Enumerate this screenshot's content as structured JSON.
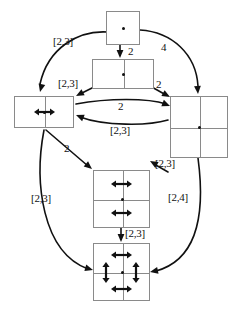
{
  "figure": {
    "type": "state-transition-diagram",
    "background_color": "#ffffff",
    "box_stroke_color": "#8a8a8a",
    "edge_stroke_color": "#111111",
    "label_color": "#111111"
  },
  "nodes": [
    {
      "id": "n1",
      "name": "top-single-cell-node",
      "grid": {
        "cols": 1,
        "rows": 1
      },
      "x": 106,
      "y": 11,
      "w": 34,
      "h": 34,
      "arrows": []
    },
    {
      "id": "n2",
      "name": "upper-two-cell-horizontal-node",
      "grid": {
        "cols": 2,
        "rows": 1
      },
      "x": 92,
      "y": 59,
      "w": 62,
      "h": 30,
      "arrows": []
    },
    {
      "id": "n3",
      "name": "left-two-cell-node-with-horizontal-arrow",
      "grid": {
        "cols": 2,
        "rows": 1
      },
      "x": 14,
      "y": 96,
      "w": 60,
      "h": 32,
      "arrows": [
        {
          "type": "horizontal",
          "cx": 44,
          "cy": 112,
          "len": 21
        }
      ]
    },
    {
      "id": "n4",
      "name": "right-four-cell-node",
      "grid": {
        "cols": 2,
        "rows": 2
      },
      "x": 170,
      "y": 96,
      "w": 58,
      "h": 62,
      "arrows": []
    },
    {
      "id": "n5",
      "name": "middle-four-cell-node-with-two-horizontal-arrows",
      "grid": {
        "cols": 2,
        "rows": 2
      },
      "x": 93,
      "y": 170,
      "w": 57,
      "h": 58,
      "arrows": [
        {
          "type": "horizontal",
          "cx": 121,
          "cy": 184,
          "len": 21
        },
        {
          "type": "horizontal",
          "cx": 121,
          "cy": 213,
          "len": 21
        }
      ]
    },
    {
      "id": "n6",
      "name": "bottom-four-cell-node-with-four-arrows",
      "grid": {
        "cols": 2,
        "rows": 2
      },
      "x": 93,
      "y": 243,
      "w": 57,
      "h": 58,
      "arrows": [
        {
          "type": "horizontal",
          "cx": 121,
          "cy": 255,
          "len": 21
        },
        {
          "type": "horizontal",
          "cx": 121,
          "cy": 289,
          "len": 21
        },
        {
          "type": "vertical",
          "cx": 106,
          "cy": 272,
          "len": 21
        },
        {
          "type": "vertical",
          "cx": 136,
          "cy": 272,
          "len": 21
        }
      ]
    }
  ],
  "edges": [
    {
      "id": "e1",
      "name": "edge-top-node-to-left-node",
      "from": "n1",
      "to": "n3",
      "label": "[2,3]",
      "label_x": 53,
      "label_y": 36,
      "path": "M 108 32 C 78 30 48 48 40 84",
      "arrow_at": {
        "x": 40,
        "y": 92,
        "angle": 104
      }
    },
    {
      "id": "e2",
      "name": "edge-top-node-to-right-node",
      "from": "n1",
      "to": "n4",
      "label": "4",
      "label_x": 161,
      "label_y": 42,
      "path": "M 140 30 C 172 32 196 54 198 86",
      "arrow_at": {
        "x": 198,
        "y": 94,
        "angle": 86
      }
    },
    {
      "id": "e3",
      "name": "edge-top-node-to-upper-two-cell-node",
      "from": "n1",
      "to": "n2",
      "label": "2",
      "label_x": 128,
      "label_y": 46,
      "path": "M 120 45 L 120 55",
      "arrow_at": {
        "x": 120,
        "y": 58,
        "angle": 90
      }
    },
    {
      "id": "e4",
      "name": "edge-upper-node-to-left-node",
      "from": "n2",
      "to": "n3",
      "label": "[2,3]",
      "label_x": 58,
      "label_y": 78,
      "path": "M 96 86 L 80 94",
      "arrow_at": {
        "x": 76,
        "y": 96,
        "angle": 152
      }
    },
    {
      "id": "e5",
      "name": "edge-upper-node-to-right-node",
      "from": "n2",
      "to": "n4",
      "label": "2",
      "label_x": 156,
      "label_y": 79,
      "path": "M 150 86 L 166 95",
      "arrow_at": {
        "x": 170,
        "y": 97,
        "angle": 29
      }
    },
    {
      "id": "e6",
      "name": "edge-left-node-to-right-node",
      "from": "n3",
      "to": "n4",
      "label": "2",
      "label_x": 118,
      "label_y": 101,
      "path": "M 76 104 C 108 98 148 98 166 104",
      "arrow_at": {
        "x": 170,
        "y": 106,
        "angle": 22
      }
    },
    {
      "id": "e7",
      "name": "edge-right-node-to-left-node",
      "from": "n4",
      "to": "n3",
      "label": "[2,3]",
      "label_x": 110,
      "label_y": 125,
      "path": "M 168 120 C 148 126 104 126 80 117",
      "arrow_at": {
        "x": 76,
        "y": 115,
        "angle": 202
      }
    },
    {
      "id": "e8",
      "name": "edge-left-node-to-middle-node",
      "from": "n3",
      "to": "n5",
      "label": "2",
      "label_x": 64,
      "label_y": 143,
      "path": "M 46 130 L 88 166",
      "arrow_at": {
        "x": 92,
        "y": 169,
        "angle": 40
      }
    },
    {
      "id": "e9",
      "name": "edge-left-node-to-bottom-node",
      "from": "n3",
      "to": "n6",
      "label": "[2,3]",
      "label_x": 31,
      "label_y": 193,
      "path": "M 44 130 C 34 182 42 252 88 269",
      "arrow_at": {
        "x": 93,
        "y": 270,
        "angle": 16
      }
    },
    {
      "id": "e10",
      "name": "edge-right-node-to-middle-node",
      "from": "n4",
      "to": "n5",
      "label": "[2,3]",
      "label_x": 155,
      "label_y": 158,
      "path": "M 168 172 L 154 164",
      "arrow_at": {
        "x": 150,
        "y": 161,
        "angle": 210
      }
    },
    {
      "id": "e11",
      "name": "edge-right-node-to-bottom-node",
      "from": "n4",
      "to": "n6",
      "label": "[2,4]",
      "label_x": 168,
      "label_y": 192,
      "path": "M 198 158 C 206 218 196 260 156 271",
      "arrow_at": {
        "x": 150,
        "y": 272,
        "angle": 168
      }
    },
    {
      "id": "e12",
      "name": "edge-middle-node-to-bottom-node",
      "from": "n5",
      "to": "n6",
      "label": "[2,3]",
      "label_x": 125,
      "label_y": 228,
      "path": "M 121 228 L 121 239",
      "arrow_at": {
        "x": 121,
        "y": 242,
        "angle": 90
      }
    }
  ]
}
